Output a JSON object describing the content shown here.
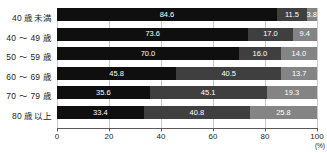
{
  "chart_data": {
    "type": "bar",
    "orientation": "horizontal",
    "stacked": true,
    "normalized_percent": true,
    "title": "",
    "xlabel": "",
    "ylabel": "",
    "unit_label": "(%)",
    "xlim": [
      0,
      100
    ],
    "xticks": [
      0,
      20,
      40,
      60,
      80,
      100
    ],
    "xtick_labels": [
      "0",
      "20",
      "40",
      "60",
      "80",
      "100"
    ],
    "grid": true,
    "legend": "none",
    "categories": [
      "40 歳未満",
      "40 ～ 49 歳",
      "50 ～ 59 歳",
      "60 ～ 69 歳",
      "70 ～ 79 歳",
      "80 歳以上"
    ],
    "series": [
      {
        "name": "series-1",
        "color": "#0f0f0f",
        "values": [
          84.6,
          73.6,
          70.0,
          45.8,
          35.6,
          33.4
        ]
      },
      {
        "name": "series-2",
        "color": "#3f3f3f",
        "values": [
          11.5,
          17.0,
          16.0,
          40.5,
          45.1,
          40.8
        ]
      },
      {
        "name": "series-3",
        "color": "#848484",
        "values": [
          3.8,
          9.4,
          14.0,
          13.7,
          19.3,
          25.8
        ]
      }
    ],
    "rows": [
      {
        "label": "40 歳未満",
        "values": [
          84.6,
          11.5,
          3.8
        ]
      },
      {
        "label": "40 ～ 49 歳",
        "values": [
          73.6,
          17.0,
          9.4
        ]
      },
      {
        "label": "50 ～ 59 歳",
        "values": [
          70.0,
          16.0,
          14.0
        ]
      },
      {
        "label": "60 ～ 69 歳",
        "values": [
          45.8,
          40.5,
          13.7
        ]
      },
      {
        "label": "70 ～ 79 歳",
        "values": [
          35.6,
          45.1,
          19.3
        ]
      },
      {
        "label": "80 歳以上",
        "values": [
          33.4,
          40.8,
          25.8
        ]
      }
    ],
    "value_labels": [
      [
        "84.6",
        "11.5",
        "3.8"
      ],
      [
        "73.6",
        "17.0",
        "9.4"
      ],
      [
        "70.0",
        "16.0",
        "14.0"
      ],
      [
        "45.8",
        "40.5",
        "13.7"
      ],
      [
        "35.6",
        "45.1",
        "19.3"
      ],
      [
        "33.4",
        "40.8",
        "25.8"
      ]
    ]
  }
}
